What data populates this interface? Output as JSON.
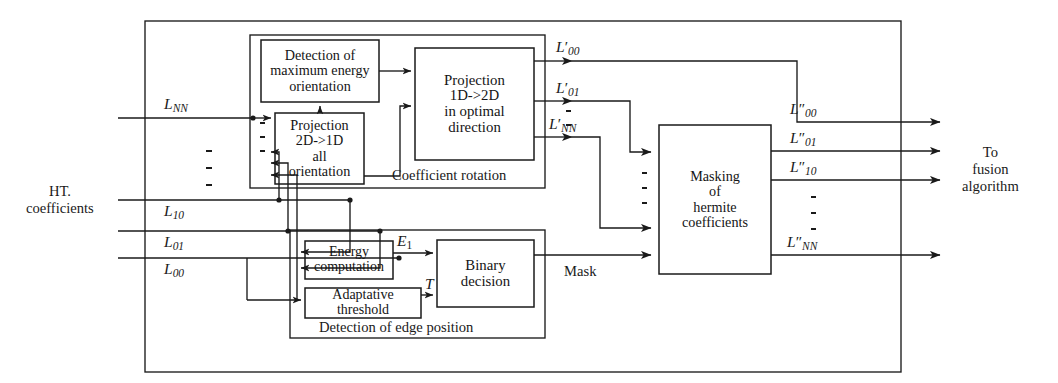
{
  "diagram": {
    "inputs": {
      "source_label_line1": "HT.",
      "source_label_line2": "coefficients",
      "signals": [
        {
          "name": "L",
          "sub": "NN",
          "prime": ""
        },
        {
          "name": "L",
          "sub": "10",
          "prime": ""
        },
        {
          "name": "L",
          "sub": "01",
          "prime": ""
        },
        {
          "name": "L",
          "sub": "00",
          "prime": ""
        }
      ],
      "vertical_ellipsis": "⋮"
    },
    "blocks": [
      {
        "id": "detection-max-energy",
        "lines": [
          "Detection of",
          "maximum energy",
          "orientation"
        ]
      },
      {
        "id": "projection-2d-1d",
        "lines": [
          "Projection",
          "2D->1D",
          "all",
          "orientation"
        ]
      },
      {
        "id": "projection-1d-2d",
        "lines": [
          "Projection",
          "1D->2D",
          "in optimal",
          "direction"
        ]
      },
      {
        "id": "masking-hermite",
        "lines": [
          "Masking",
          "of",
          "hermite",
          "coefficients"
        ]
      },
      {
        "id": "energy-computation",
        "lines": [
          "Energy",
          "computation"
        ]
      },
      {
        "id": "adaptative-threshold",
        "lines": [
          "Adaptative",
          "threshold"
        ]
      },
      {
        "id": "binary-decision",
        "lines": [
          "Binary",
          "decision"
        ]
      }
    ],
    "group_captions": {
      "coefficient_rotation": "Coefficient rotation",
      "edge_detection": "Detection of edge position"
    },
    "intermediate_signals": {
      "energy": {
        "name": "E",
        "sub": "1"
      },
      "threshold": {
        "name": "T",
        "sub": ""
      },
      "mask": "Mask"
    },
    "rotated_outputs": [
      {
        "name": "L",
        "prime": "′",
        "sub": "00"
      },
      {
        "name": "L",
        "prime": "′",
        "sub": "01"
      },
      {
        "name": "L",
        "prime": "′",
        "sub": "NN"
      }
    ],
    "masked_outputs": [
      {
        "name": "L",
        "prime": "″",
        "sub": "00"
      },
      {
        "name": "L",
        "prime": "″",
        "sub": "01"
      },
      {
        "name": "L",
        "prime": "″",
        "sub": "10"
      },
      {
        "name": "L",
        "prime": "″",
        "sub": "NN"
      }
    ],
    "destination": {
      "line1": "To",
      "line2": "fusion",
      "line3": "algorithm"
    },
    "colors": {
      "stroke": "#1a1a1a",
      "background": "#ffffff",
      "text": "#141414"
    }
  }
}
